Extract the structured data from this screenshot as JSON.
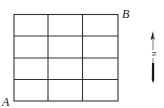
{
  "diagram": {
    "grid": {
      "columns": 3,
      "rows": 4,
      "line_color": "#333333"
    },
    "labels": {
      "corner_bottom_left": "A",
      "corner_top_right": "B"
    },
    "north_arrow": {
      "label": "N"
    }
  }
}
